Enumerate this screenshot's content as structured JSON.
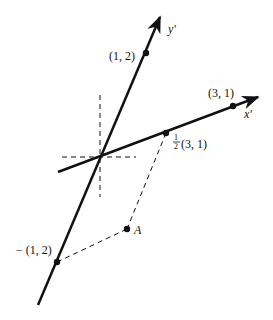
{
  "diagram": {
    "colors": {
      "line": "#111111",
      "background": "#ffffff"
    },
    "axes": {
      "x_prime": {
        "label": "x'"
      },
      "y_prime": {
        "label": "y'"
      }
    },
    "points": {
      "y_basis": {
        "label": "(1, 2)"
      },
      "x_basis": {
        "label": "(3, 1)"
      },
      "half_x_basis": {
        "frac_num": "1",
        "frac_den": "2",
        "label": "(3, 1)"
      },
      "neg_y_basis": {
        "label": "− (1, 2)"
      },
      "A": {
        "label": "A"
      }
    }
  }
}
